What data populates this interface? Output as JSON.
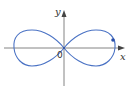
{
  "diagram": {
    "type": "lemniscate-curve",
    "axes": {
      "x_label": "x",
      "y_label": "y",
      "origin_label": "0",
      "axis_color": "#555555"
    },
    "curve": {
      "color": "#4a72c4",
      "shape": "figure-eight"
    },
    "point": {
      "color": "#2a4fa8"
    }
  }
}
